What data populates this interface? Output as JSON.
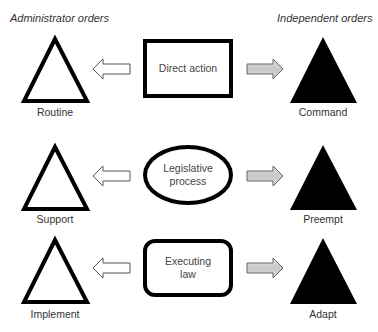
{
  "headers": {
    "left": "Administrator orders",
    "right": "Independent orders"
  },
  "rows": [
    {
      "left_label": "Routine",
      "center_label": "Direct action",
      "center_shape": "rectangle",
      "right_label": "Command"
    },
    {
      "left_label": "Support",
      "center_label": "Legislative process",
      "center_shape": "ellipse",
      "right_label": "Preempt"
    },
    {
      "left_label": "Implement",
      "center_label": "Executing law",
      "center_shape": "rounded-rectangle",
      "right_label": "Adapt"
    }
  ],
  "legend": {
    "left_triangle": "outline triangle",
    "right_triangle": "filled triangle",
    "left_arrow": "hollow arrow pointing left",
    "right_arrow": "gray filled arrow pointing right"
  },
  "colors": {
    "stroke": "#000000",
    "fill_dark": "#000000",
    "arrow_fill_right": "#cfcfcf",
    "arrow_fill_left": "#ffffff",
    "text": "#333333"
  }
}
